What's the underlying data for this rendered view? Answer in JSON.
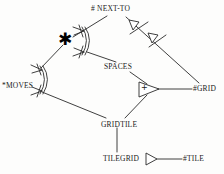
{
  "diagram": {
    "title": "",
    "stroke_color": "#2a2a2a",
    "fill_color": "#ffffff",
    "background_color": "#fdfdfc",
    "nodes": [
      {
        "id": "next-to",
        "label": "# NEXT-TO",
        "x": 91,
        "y": 6
      },
      {
        "id": "moves",
        "label": "*MOVES",
        "x": 3,
        "y": 82
      },
      {
        "id": "spaces",
        "label": "SPACES",
        "x": 104,
        "y": 64
      },
      {
        "id": "grid",
        "label": "#GRID",
        "x": 194,
        "y": 89
      },
      {
        "id": "gridtile",
        "label": "GRIDTILE",
        "x": 101,
        "y": 122
      },
      {
        "id": "tilegrid",
        "label": "TILEGRID",
        "x": 104,
        "y": 158
      },
      {
        "id": "tile",
        "label": "#TILE",
        "x": 184,
        "y": 158
      }
    ],
    "glyphs": [
      {
        "id": "star",
        "symbol": "✱",
        "x": 62,
        "y": 34
      },
      {
        "id": "plus",
        "symbol": "+",
        "x": 142,
        "y": 84
      }
    ],
    "edges": [
      {
        "id": "e-star-nextto",
        "from": "star",
        "to": "next-to"
      },
      {
        "id": "e-star-moves",
        "from": "star",
        "to": "moves"
      },
      {
        "id": "e-arc-spaces",
        "from": "arc-top",
        "to": "spaces"
      },
      {
        "id": "e-nextto-grid",
        "from": "next-to",
        "to": "grid"
      },
      {
        "id": "e-spaces-union",
        "from": "spaces",
        "to": "union"
      },
      {
        "id": "e-union-grid",
        "from": "union",
        "to": "grid"
      },
      {
        "id": "e-union-gridtile",
        "from": "union",
        "to": "gridtile"
      },
      {
        "id": "e-moves-gridtile",
        "from": "moves",
        "to": "gridtile"
      },
      {
        "id": "e-gridtile-tilegrid",
        "from": "gridtile",
        "to": "tilegrid"
      },
      {
        "id": "e-tilegrid-tile",
        "from": "tilegrid",
        "to": "tile"
      }
    ],
    "markers": [
      {
        "id": "arc-moves",
        "type": "double-arc-crowsfoot",
        "x": 42,
        "y": 78
      },
      {
        "id": "arc-star",
        "type": "double-arc-crowsfoot",
        "x": 84,
        "y": 40
      },
      {
        "id": "tri-nextto-a",
        "type": "open-triangle-tick",
        "x": 131,
        "y": 22
      },
      {
        "id": "tri-nextto-b",
        "type": "open-triangle-tick",
        "x": 152,
        "y": 36
      },
      {
        "id": "tri-union",
        "type": "union-triangle",
        "x": 148,
        "y": 88
      },
      {
        "id": "tri-tile",
        "type": "open-triangle",
        "x": 148,
        "y": 159
      }
    ]
  }
}
